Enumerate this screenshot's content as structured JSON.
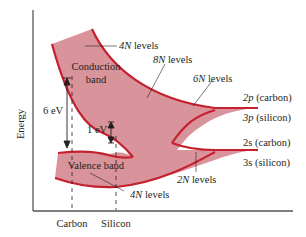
{
  "diagram": {
    "axis": {
      "ylabel": "Energy",
      "xticks": [
        "Carbon",
        "Silicon"
      ]
    },
    "bands": {
      "conduction": "Conduction band",
      "conduction_line1": "Conduction",
      "conduction_line2": "band",
      "valence": "Valence band"
    },
    "gaps": {
      "carbon": "6 eV",
      "silicon": "1 eV"
    },
    "level_labels": {
      "top": "4N levels",
      "upper_mid": "8N levels",
      "six": "6N levels",
      "two": "2N levels",
      "bottom": "4N levels"
    },
    "atomic_levels": {
      "p_carbon_sym": "2p",
      "p_carbon_txt": " (carbon)",
      "p_silicon_sym": "3p",
      "p_silicon_txt": " (silicon)",
      "s_carbon_sym": "2s",
      "s_carbon_txt": " (carbon)",
      "s_silicon_sym": "3s",
      "s_silicon_txt": " (silicon)"
    },
    "colors": {
      "band_fill": "#d9939a",
      "band_edge": "#c4202e",
      "axis": "#555555",
      "text": "#231f20"
    }
  }
}
